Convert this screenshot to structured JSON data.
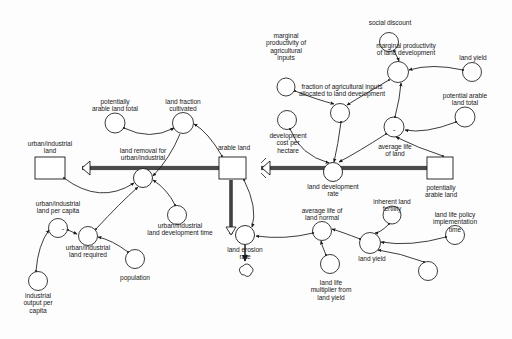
{
  "diagram": {
    "type": "system-dynamics-stock-and-flow",
    "background_color": "#fdfdfd",
    "line_color": "#1a1a1a",
    "text_color": "#1a1a1a"
  },
  "stocks": [
    {
      "id": "urban_industrial_land",
      "label": "urban/industrial\nland",
      "x": 50,
      "y": 172,
      "w": 30,
      "h": 22,
      "label_x": 50,
      "label_y": 145
    },
    {
      "id": "arable_land",
      "label": "arable land",
      "x": 233,
      "y": 172,
      "w": 27,
      "h": 22,
      "label_x": 233,
      "label_y": 149
    },
    {
      "id": "potentially_arable_land",
      "label": "potentially\narable land",
      "x": 440,
      "y": 172,
      "w": 26,
      "h": 22,
      "label_x": 440,
      "label_y": 196
    }
  ],
  "flows": [
    {
      "id": "land_removal_for_urban_industrial",
      "label": "land removal for\nurban/industrial",
      "x": 143,
      "y": 178,
      "label_x": 143,
      "label_y": 152
    },
    {
      "id": "land_development_rate",
      "label": "land development\nrate",
      "x": 333,
      "y": 172,
      "label_x": 333,
      "label_y": 181
    },
    {
      "id": "land_erosion_rate",
      "label": "land erosion\nrate",
      "x": 245,
      "y": 235,
      "label_x": 245,
      "label_y": 244
    }
  ],
  "sinks": [
    {
      "id": "land_erosion_sink",
      "label": "cloud-sink",
      "x": 245,
      "y": 272
    }
  ],
  "auxiliaries": [
    {
      "id": "potentially_arable_land_total",
      "label": "potentially\narable land total",
      "x": 115,
      "y": 123,
      "label_x": 115,
      "label_y": 102
    },
    {
      "id": "land_fraction_cultivated",
      "label": "land fraction\ncultivated",
      "x": 183,
      "y": 123,
      "label_x": 183,
      "label_y": 102
    },
    {
      "id": "urban_industrial_land_per_capita",
      "label": "urban/industrial\nland per capita",
      "x": 58,
      "y": 228,
      "label_x": 58,
      "label_y": 206
    },
    {
      "id": "urban_industrial_land_required",
      "label": "urban/industrial\nland required",
      "x": 88,
      "y": 236,
      "label_x": 88,
      "label_y": 246
    },
    {
      "id": "industrial_output_per_capita",
      "label": "industrial\noutput per\ncapita",
      "x": 38,
      "y": 281,
      "label_x": 38,
      "label_y": 292
    },
    {
      "id": "population",
      "label": "population",
      "x": 135,
      "y": 259,
      "label_x": 135,
      "label_y": 277
    },
    {
      "id": "urban_industrial_land_development_time",
      "label": "urban/industrial\nland development time",
      "x": 177,
      "y": 215,
      "label_x": 180,
      "label_y": 228
    },
    {
      "id": "marginal_productivity_of_agricultural_inputs",
      "label": "marginal\nproductivity of\nagricultural\ninputs",
      "x": 286,
      "y": 87,
      "label_x": 286,
      "label_y": 34
    },
    {
      "id": "fraction_of_agricultural_inputs_allocated",
      "label": "fraction of agricultural inputs\nallocated to land development",
      "x": 340,
      "y": 113,
      "label_x": 340,
      "label_y": 89
    },
    {
      "id": "social_discount",
      "label": "social discount",
      "x": 389,
      "y": 42,
      "label_x": 389,
      "label_y": 22
    },
    {
      "id": "marginal_productivity_of_land_development",
      "label": "marginal productivity\nof land development",
      "x": 398,
      "y": 72,
      "label_x": 405,
      "label_y": 47
    },
    {
      "id": "land_yield_top",
      "label": "land yield",
      "x": 472,
      "y": 72,
      "label_x": 472,
      "label_y": 57
    },
    {
      "id": "potential_arable_land_total",
      "label": "potential arable\nland total",
      "x": 465,
      "y": 117,
      "label_x": 465,
      "label_y": 96
    },
    {
      "id": "total_agricultural_investment",
      "label": "total\nagricultural\ninvestment",
      "x": 287,
      "y": 130,
      "label_x": 287,
      "label_y": 140
    },
    {
      "id": "development_cost_per_hectare",
      "label": "development\ncost per\nhectare",
      "x": 394,
      "y": 127,
      "label_x": 394,
      "label_y": 158
    },
    {
      "id": "average_life_of_land",
      "label": "average life\nof land",
      "x": 322,
      "y": 231,
      "label_x": 322,
      "label_y": 211
    },
    {
      "id": "average_life_of_land_normal",
      "label": "average life of\nland normal",
      "x": 330,
      "y": 264,
      "label_x": 330,
      "label_y": 279
    },
    {
      "id": "land_life_multiplier_from_land_yield",
      "label": "land life\nmultiplier from\nland yield",
      "x": 370,
      "y": 243,
      "label_x": 372,
      "label_y": 254
    },
    {
      "id": "land_yield_lower",
      "label": "land yield",
      "x": 392,
      "y": 215,
      "label_x": 392,
      "label_y": 200
    },
    {
      "id": "inherent_land_fertility",
      "label": "inherent land\nfertility",
      "x": 455,
      "y": 235,
      "label_x": 455,
      "label_y": 215
    },
    {
      "id": "land_life_policy_implementation_time",
      "label": "land life policy\nimplementation\ntime",
      "x": 428,
      "y": 281,
      "label_x": 428,
      "label_y": 292
    }
  ],
  "polarity_marks": [
    {
      "id": "minus-urban-land-per-capita",
      "symbol": "-",
      "x": 63,
      "y": 231
    },
    {
      "id": "minus-development-cost",
      "symbol": "-",
      "x": 398,
      "y": 131
    }
  ]
}
